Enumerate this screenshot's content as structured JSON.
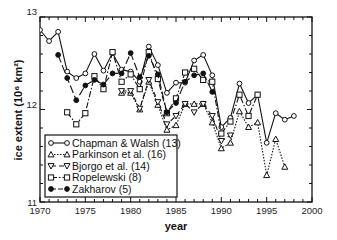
{
  "chart_data": {
    "type": "line",
    "title": "",
    "xlabel": "year",
    "ylabel": "ice extent (10⁶ km²)",
    "xlim": [
      1970,
      2000
    ],
    "ylim": [
      11,
      13
    ],
    "xticks": [
      1970,
      1975,
      1980,
      1985,
      1990,
      1995,
      2000
    ],
    "yticks": [
      11,
      12,
      13
    ],
    "grid": false,
    "legend_position": "lower left (inside plot)",
    "series": [
      {
        "name": "Chapman & Walsh (13)",
        "marker": "circle-open",
        "linestyle": "solid",
        "x": [
          1970,
          1971,
          1972,
          1973,
          1974,
          1975,
          1976,
          1977,
          1978,
          1979,
          1980,
          1981,
          1982,
          1983,
          1984,
          1985,
          1986,
          1987,
          1988,
          1989,
          1990,
          1991,
          1992,
          1993,
          1994,
          1995,
          1996,
          1997,
          1998
        ],
        "values": [
          12.86,
          12.74,
          12.84,
          12.41,
          12.34,
          12.39,
          12.6,
          12.42,
          12.61,
          12.43,
          12.41,
          12.3,
          12.68,
          12.48,
          12.18,
          12.29,
          12.29,
          12.53,
          12.59,
          12.37,
          11.81,
          11.91,
          12.28,
          12.07,
          12.16,
          11.64,
          11.96,
          11.89,
          11.93
        ]
      },
      {
        "name": "Parkinson et al. (16)",
        "marker": "triangle-up-open",
        "linestyle": "dotted",
        "x": [
          1979,
          1980,
          1981,
          1982,
          1983,
          1984,
          1985,
          1986,
          1987,
          1988,
          1989,
          1990,
          1991,
          1992,
          1993,
          1994,
          1995,
          1996,
          1997
        ],
        "values": [
          12.18,
          12.18,
          12.0,
          12.3,
          12.05,
          11.78,
          11.83,
          12.06,
          12.06,
          12.06,
          11.86,
          11.58,
          11.64,
          11.98,
          11.81,
          11.86,
          11.29,
          11.68,
          11.38
        ]
      },
      {
        "name": "Bjorgo et al. (14)",
        "marker": "triangle-down-open",
        "linestyle": "dashed",
        "x": [
          1979,
          1980,
          1981,
          1982,
          1983,
          1984,
          1985,
          1986,
          1987,
          1988,
          1989,
          1990,
          1991
        ],
        "values": [
          12.2,
          12.2,
          12.01,
          12.32,
          12.08,
          11.84,
          11.93,
          12.06,
          11.97,
          12.06,
          11.93,
          11.66,
          11.72
        ]
      },
      {
        "name": "Ropelewski (8)",
        "marker": "square-open",
        "linestyle": "dash-dot",
        "x": [
          1973,
          1974,
          1975,
          1976,
          1977,
          1978,
          1979,
          1980,
          1981,
          1982,
          1983,
          1984,
          1985,
          1986,
          1987,
          1988,
          1989,
          1990,
          1991,
          1992,
          1993,
          1994
        ],
        "values": [
          11.97,
          11.84,
          11.96,
          12.36,
          12.22,
          12.62,
          12.3,
          12.38,
          12.22,
          12.62,
          12.33,
          11.96,
          12.12,
          12.4,
          12.44,
          12.32,
          12.3,
          11.74,
          11.87,
          12.16,
          11.93,
          12.16
        ]
      },
      {
        "name": "Zakharov (5)",
        "marker": "circle-filled",
        "linestyle": "long-dash",
        "x": [
          1972,
          1973,
          1974,
          1975,
          1976,
          1977,
          1978,
          1979,
          1980,
          1981,
          1982,
          1983,
          1984,
          1985,
          1986,
          1987,
          1988,
          1989
        ],
        "values": [
          12.59,
          12.34,
          12.1,
          12.26,
          12.32,
          12.27,
          12.39,
          12.39,
          12.61,
          12.35,
          12.58,
          12.38,
          11.97,
          12.07,
          12.3,
          12.37,
          12.39,
          12.19
        ]
      }
    ]
  }
}
